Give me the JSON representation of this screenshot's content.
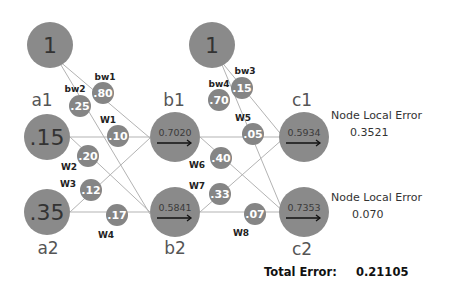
{
  "diagram": {
    "nodes": {
      "bias_a": {
        "value": "1"
      },
      "a1": {
        "label": "a1",
        "value": ".15"
      },
      "a2": {
        "label": "a2",
        "value": ".35"
      },
      "bias_b": {
        "value": "1"
      },
      "b1": {
        "label": "b1",
        "value": "0.7020"
      },
      "b2": {
        "label": "b2",
        "value": "0.5841"
      },
      "c1": {
        "label": "c1",
        "value": "0.5934"
      },
      "c2": {
        "label": "c2",
        "value": "0.7353"
      }
    },
    "weights": {
      "bw1": {
        "label": "bw1",
        "value": ".80"
      },
      "bw2": {
        "label": "bw2",
        "value": ".25"
      },
      "w1": {
        "label": "W1",
        "value": ".10"
      },
      "w2": {
        "label": "W2",
        "value": ".20"
      },
      "w3": {
        "label": "W3",
        "value": ".12"
      },
      "w4": {
        "label": "W4",
        "value": ".17"
      },
      "bw3": {
        "label": "bw3",
        "value": ".15"
      },
      "bw4": {
        "label": "bw4",
        "value": ".70"
      },
      "w5": {
        "label": "W5",
        "value": ".05"
      },
      "w6": {
        "label": "W6",
        "value": ".40"
      },
      "w7": {
        "label": "W7",
        "value": ".33"
      },
      "w8": {
        "label": "W8",
        "value": ".07"
      }
    },
    "errors": {
      "c1": {
        "label": "Node Local Error",
        "value": "0.3521"
      },
      "c2": {
        "label": "Node Local Error",
        "value": "0.070"
      }
    },
    "total_error": {
      "label": "Total Error:",
      "value": "0.21105"
    }
  }
}
